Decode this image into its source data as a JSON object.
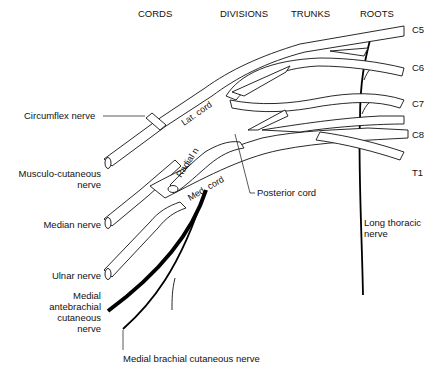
{
  "diagram": {
    "column_headers": [
      "CORDS",
      "DIVISIONS",
      "TRUNKS",
      "ROOTS"
    ],
    "roots": [
      "C5",
      "C6",
      "C7",
      "C8",
      "T1"
    ],
    "inner_labels": {
      "lateral_cord": "Lat. cord",
      "radial_nerve": "Radial n",
      "medial_cord": "Med. cord"
    },
    "left_labels": {
      "circumflex": "Circumflex nerve",
      "musculocutaneous_1": "Musculo-cutaneous",
      "musculocutaneous_2": "nerve",
      "median": "Median nerve",
      "ulnar": "Ulnar nerve",
      "medial_antebrachial_1": "Medial",
      "medial_antebrachial_2": "antebrachial",
      "medial_antebrachial_3": "cutaneous",
      "medial_antebrachial_4": "nerve"
    },
    "other_labels": {
      "posterior_cord": "Posterior cord",
      "long_thoracic_1": "Long thoracic",
      "long_thoracic_2": "nerve",
      "medial_brachial": "Medial brachial cutaneous nerve"
    }
  }
}
